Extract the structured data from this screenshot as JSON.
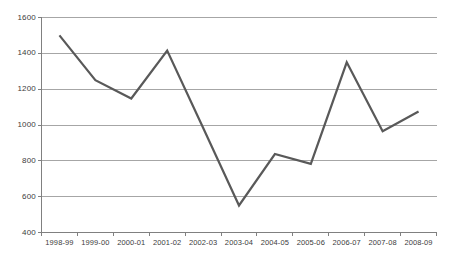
{
  "chart_data": {
    "type": "line",
    "title": "",
    "subtitle": "",
    "xlabel": "",
    "ylabel": "",
    "categories": [
      "1998-99",
      "1999-00",
      "2000-01",
      "2001-02",
      "2002-03",
      "2003-04",
      "2004-05",
      "2005-06",
      "2006-07",
      "2007-08",
      "2008-09"
    ],
    "values": [
      1500,
      1250,
      1148,
      1415,
      985,
      551,
      838,
      783,
      1350,
      965,
      1075
    ],
    "series": [
      {
        "name": "",
        "values": [
          1500,
          1250,
          1148,
          1415,
          985,
          551,
          838,
          783,
          1350,
          965,
          1075
        ]
      }
    ],
    "ylim": [
      400,
      1600
    ],
    "yticks": [
      400,
      600,
      800,
      1000,
      1200,
      1400,
      1600
    ],
    "ytick_labels": [
      "400",
      "600",
      "800",
      "1000",
      "1200",
      "1400",
      "1600"
    ],
    "grid": true,
    "grid_axis": "y",
    "legend": false,
    "legend_position": "none",
    "markers": false,
    "annotations": []
  },
  "style": {
    "line_color": "#595959",
    "grid_color": "#a6a6a6",
    "axis_color": "#808080",
    "text_color": "#3c3c3c",
    "background_color": "#ffffff"
  }
}
